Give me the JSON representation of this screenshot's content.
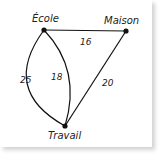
{
  "graph": {
    "nodes": [
      {
        "id": "ecole",
        "label": "École",
        "x": 44,
        "y": 30
      },
      {
        "id": "maison",
        "label": "Maison",
        "x": 126,
        "y": 31
      },
      {
        "id": "travail",
        "label": "Travail",
        "x": 65,
        "y": 126
      }
    ],
    "edges": [
      {
        "from": "ecole",
        "to": "maison",
        "weight": "16"
      },
      {
        "from": "ecole",
        "to": "travail",
        "weight": "25",
        "route": "outer-curve"
      },
      {
        "from": "ecole",
        "to": "travail",
        "weight": "18",
        "route": "inner-curve"
      },
      {
        "from": "maison",
        "to": "travail",
        "weight": "20"
      }
    ]
  },
  "colors": {
    "line": "#111111",
    "text": "#222222",
    "background": "#ffffff"
  }
}
